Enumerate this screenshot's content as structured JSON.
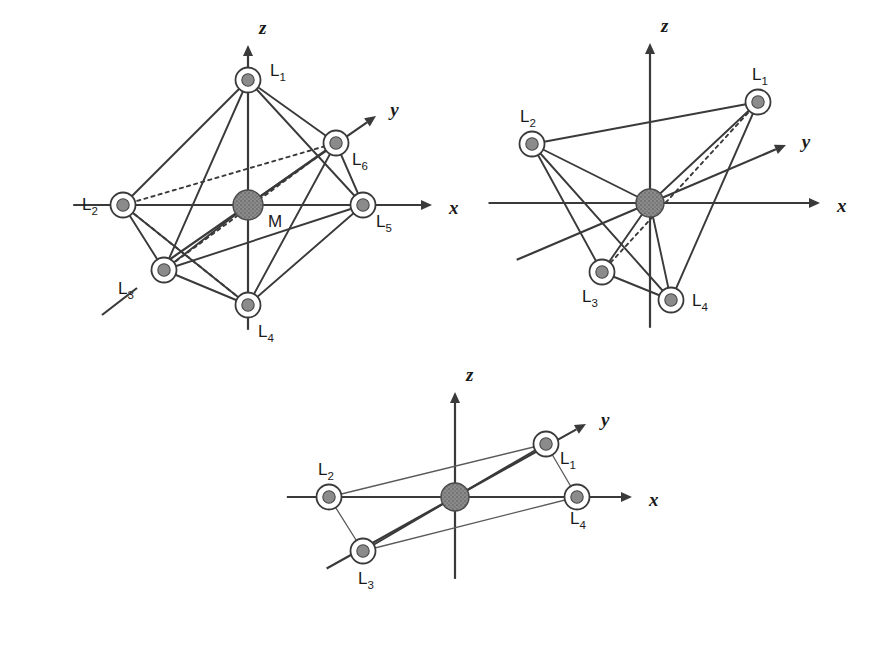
{
  "figure": {
    "title": "",
    "background_color": "#ffffff",
    "line_color": "#3a3a3a",
    "metal_color": "#8b8b8b",
    "ligand_color": "#8b8b8b",
    "width": 885,
    "height": 660
  },
  "chart_data": {
    "type": "diagram",
    "title": "",
    "subtitle": "",
    "xlabel": "",
    "ylabel": "",
    "panels": [
      {
        "id": "octahedral",
        "name": "octahedral",
        "coordination_number": 6,
        "origin": [
          248,
          205
        ],
        "axes": [
          {
            "name": "z",
            "label": "z",
            "direction": "up",
            "tip": [
              248,
              45
            ]
          },
          {
            "name": "x",
            "label": "x",
            "direction": "right",
            "tip": [
              432,
              205
            ]
          },
          {
            "name": "y",
            "label": "y",
            "direction": "upper-right",
            "tip": [
              376,
              116
            ]
          }
        ],
        "center": {
          "label": "M",
          "x": 248,
          "y": 205,
          "radius": 15
        },
        "ligands": [
          {
            "label": "L",
            "sub": "1",
            "x": 248,
            "y": 80,
            "label_x": 270,
            "label_y": 76
          },
          {
            "label": "L",
            "sub": "2",
            "x": 123,
            "y": 205,
            "label_x": 82,
            "label_y": 210
          },
          {
            "label": "L",
            "sub": "3",
            "x": 164,
            "y": 270,
            "label_x": 118,
            "label_y": 294
          },
          {
            "label": "L",
            "sub": "4",
            "x": 248,
            "y": 305,
            "label_x": 258,
            "label_y": 337
          },
          {
            "label": "L",
            "sub": "5",
            "x": 363,
            "y": 205,
            "label_x": 376,
            "label_y": 227
          },
          {
            "label": "L",
            "sub": "6",
            "x": 336,
            "y": 143,
            "label_x": 352,
            "label_y": 165
          }
        ],
        "edges": [
          [
            1,
            2
          ],
          [
            1,
            3
          ],
          [
            1,
            5
          ],
          [
            1,
            6
          ],
          [
            4,
            2
          ],
          [
            4,
            3
          ],
          [
            4,
            5
          ],
          [
            4,
            6
          ],
          [
            2,
            3
          ],
          [
            3,
            5
          ],
          [
            5,
            6
          ]
        ],
        "dashed_edges": [
          [
            2,
            6
          ],
          [
            2,
            4
          ],
          [
            3,
            6
          ]
        ],
        "center_bonds": [
          1,
          2,
          3,
          4,
          5,
          6
        ]
      },
      {
        "id": "tetrahedral",
        "name": "tetrahedral",
        "coordination_number": 4,
        "origin": [
          650,
          203
        ],
        "axes": [
          {
            "name": "z",
            "label": "z",
            "direction": "up",
            "tip": [
              650,
              43
            ]
          },
          {
            "name": "x",
            "label": "x",
            "direction": "right",
            "tip": [
              820,
              203
            ]
          },
          {
            "name": "y",
            "label": "y",
            "direction": "upper-right",
            "tip": [
              786,
              145
            ]
          }
        ],
        "center": {
          "label": "",
          "x": 650,
          "y": 203,
          "radius": 14
        },
        "ligands": [
          {
            "label": "L",
            "sub": "1",
            "x": 758,
            "y": 102,
            "label_x": 752,
            "label_y": 80
          },
          {
            "label": "L",
            "sub": "2",
            "x": 532,
            "y": 144,
            "label_x": 520,
            "label_y": 122
          },
          {
            "label": "L",
            "sub": "3",
            "x": 602,
            "y": 272,
            "label_x": 582,
            "label_y": 302
          },
          {
            "label": "L",
            "sub": "4",
            "x": 671,
            "y": 300,
            "label_x": 692,
            "label_y": 306
          }
        ],
        "edges": [
          [
            1,
            2
          ],
          [
            2,
            3
          ],
          [
            2,
            4
          ],
          [
            3,
            4
          ],
          [
            1,
            4
          ]
        ],
        "dashed_edges": [
          [
            1,
            3
          ]
        ],
        "center_bonds": [
          1,
          2,
          3,
          4
        ]
      },
      {
        "id": "square-planar",
        "name": "square planar",
        "coordination_number": 4,
        "origin": [
          455,
          497
        ],
        "axes": [
          {
            "name": "z",
            "label": "z",
            "direction": "up",
            "tip": [
              455,
              392
            ]
          },
          {
            "name": "x",
            "label": "x",
            "direction": "right",
            "tip": [
              632,
              497
            ]
          },
          {
            "name": "y",
            "label": "y",
            "direction": "upper-right",
            "tip": [
              586,
              424
            ]
          }
        ],
        "center": {
          "label": "",
          "x": 455,
          "y": 497,
          "radius": 14
        },
        "ligands": [
          {
            "label": "L",
            "sub": "1",
            "x": 546,
            "y": 444,
            "label_x": 560,
            "label_y": 464
          },
          {
            "label": "L",
            "sub": "2",
            "x": 329,
            "y": 497,
            "label_x": 318,
            "label_y": 475
          },
          {
            "label": "L",
            "sub": "3",
            "x": 363,
            "y": 551,
            "label_x": 358,
            "label_y": 584
          },
          {
            "label": "L",
            "sub": "4",
            "x": 577,
            "y": 497,
            "label_x": 570,
            "label_y": 524
          }
        ],
        "edges": [
          [
            1,
            2
          ],
          [
            2,
            3
          ],
          [
            3,
            4
          ],
          [
            4,
            1
          ]
        ],
        "dashed_edges": [],
        "center_bonds": [
          1,
          2,
          3,
          4
        ]
      }
    ]
  }
}
